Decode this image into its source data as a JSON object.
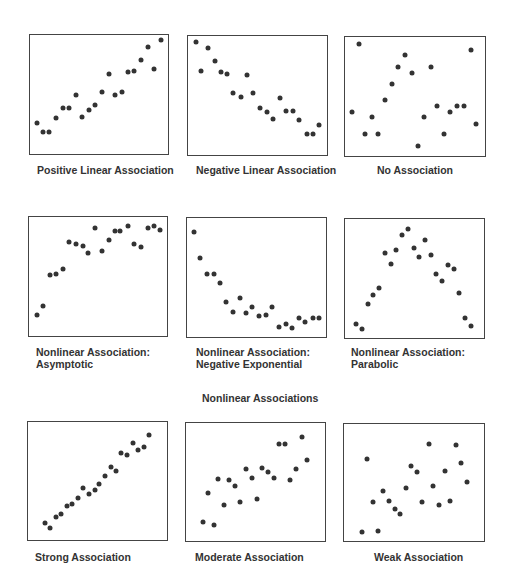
{
  "section_label": "Nonlinear Associations",
  "chart_data": [
    {
      "type": "scatter",
      "title": "Positive Linear Association",
      "points": [
        [
          4.8,
          73.6
        ],
        [
          9.1,
          81.3
        ],
        [
          14.1,
          81.3
        ],
        [
          18.9,
          70.0
        ],
        [
          23.7,
          61.7
        ],
        [
          28.3,
          61.7
        ],
        [
          33.3,
          50.7
        ],
        [
          37.9,
          68.9
        ],
        [
          42.4,
          63.1
        ],
        [
          47.2,
          59.2
        ],
        [
          52.3,
          47.9
        ],
        [
          57.1,
          32.5
        ],
        [
          61.4,
          50.4
        ],
        [
          66.4,
          47.9
        ],
        [
          71.0,
          31.4
        ],
        [
          75.5,
          30.3
        ],
        [
          80.6,
          20.9
        ],
        [
          85.4,
          9.9
        ],
        [
          89.9,
          28.9
        ],
        [
          95.0,
          4.4
        ]
      ]
    },
    {
      "type": "scatter",
      "title": "Negative Linear Association",
      "points": [
        [
          5.4,
          4.7
        ],
        [
          9.7,
          29.4
        ],
        [
          14.7,
          10.0
        ],
        [
          19.6,
          21.1
        ],
        [
          23.9,
          30.6
        ],
        [
          28.1,
          31.7
        ],
        [
          32.6,
          48.3
        ],
        [
          37.8,
          51.1
        ],
        [
          42.1,
          32.8
        ],
        [
          46.8,
          48.3
        ],
        [
          51.5,
          60.6
        ],
        [
          56.5,
          63.9
        ],
        [
          61.0,
          70.0
        ],
        [
          66.2,
          51.7
        ],
        [
          70.7,
          62.8
        ],
        [
          75.2,
          62.8
        ],
        [
          80.1,
          70.8
        ],
        [
          85.4,
          82.5
        ],
        [
          89.6,
          82.5
        ],
        [
          94.1,
          74.7
        ]
      ]
    },
    {
      "type": "scatter",
      "title": "No Association",
      "points": [
        [
          10.3,
          6.1
        ],
        [
          5.2,
          63.2
        ],
        [
          14.5,
          81.7
        ],
        [
          19.2,
          67.6
        ],
        [
          23.9,
          81.7
        ],
        [
          28.3,
          53.2
        ],
        [
          33.5,
          39.1
        ],
        [
          37.9,
          25.0
        ],
        [
          42.6,
          15.2
        ],
        [
          47.5,
          29.9
        ],
        [
          51.8,
          91.7
        ],
        [
          56.7,
          67.6
        ],
        [
          61.4,
          25.0
        ],
        [
          66.0,
          58.4
        ],
        [
          70.7,
          81.7
        ],
        [
          74.9,
          62.9
        ],
        [
          79.9,
          58.4
        ],
        [
          84.8,
          58.4
        ],
        [
          89.7,
          10.8
        ],
        [
          93.7,
          72.9
        ]
      ]
    },
    {
      "type": "scatter",
      "title": "Nonlinear Association:\nAsymptotic",
      "points": [
        [
          5.7,
          82.5
        ],
        [
          9.8,
          74.5
        ],
        [
          15.1,
          49.0
        ],
        [
          19.9,
          47.6
        ],
        [
          24.6,
          43.5
        ],
        [
          29.2,
          20.8
        ],
        [
          34.2,
          23.0
        ],
        [
          38.8,
          24.4
        ],
        [
          43.1,
          30.5
        ],
        [
          48.1,
          9.4
        ],
        [
          52.9,
          28.3
        ],
        [
          57.9,
          19.1
        ],
        [
          62.2,
          11.4
        ],
        [
          66.0,
          11.9
        ],
        [
          71.7,
          7.5
        ],
        [
          76.3,
          22.4
        ],
        [
          81.3,
          24.9
        ],
        [
          86.1,
          9.1
        ],
        [
          90.7,
          7.8
        ],
        [
          95.2,
          10.8
        ]
      ]
    },
    {
      "type": "scatter",
      "title": "Nonlinear Association:\nNegative Exponential",
      "points": [
        [
          5.2,
          11.9
        ],
        [
          9.5,
          33.2
        ],
        [
          14.5,
          46.8
        ],
        [
          19.5,
          46.8
        ],
        [
          23.8,
          54.6
        ],
        [
          28.1,
          70.4
        ],
        [
          32.9,
          79.2
        ],
        [
          37.9,
          67.0
        ],
        [
          42.1,
          80.1
        ],
        [
          46.7,
          75.1
        ],
        [
          51.9,
          82.5
        ],
        [
          56.9,
          81.4
        ],
        [
          61.2,
          75.1
        ],
        [
          66.4,
          91.4
        ],
        [
          70.9,
          89.2
        ],
        [
          75.5,
          92.5
        ],
        [
          80.5,
          83.7
        ],
        [
          85.2,
          87.0
        ],
        [
          90.5,
          83.9
        ],
        [
          95.0,
          83.9
        ]
      ]
    },
    {
      "type": "scatter",
      "title": "Nonlinear Association:\nParabolic",
      "points": [
        [
          7.8,
          87.9
        ],
        [
          12.5,
          92.6
        ],
        [
          16.3,
          71.1
        ],
        [
          20.5,
          63.6
        ],
        [
          24.8,
          57.6
        ],
        [
          28.8,
          28.4
        ],
        [
          33.0,
          38.0
        ],
        [
          36.8,
          25.9
        ],
        [
          41.0,
          13.5
        ],
        [
          45.3,
          8.3
        ],
        [
          49.5,
          24.5
        ],
        [
          53.3,
          32.2
        ],
        [
          57.8,
          17.4
        ],
        [
          61.6,
          30.3
        ],
        [
          65.8,
          46.6
        ],
        [
          70.0,
          51.8
        ],
        [
          73.8,
          38.6
        ],
        [
          78.5,
          41.6
        ],
        [
          82.3,
          62.5
        ],
        [
          86.3,
          83.2
        ],
        [
          90.3,
          89.5
        ]
      ]
    },
    {
      "type": "scatter",
      "title": "Strong Association",
      "points": [
        [
          11.9,
          85.6
        ],
        [
          15.7,
          89.9
        ],
        [
          20.0,
          80.3
        ],
        [
          24.0,
          78.0
        ],
        [
          27.9,
          71.5
        ],
        [
          31.9,
          69.6
        ],
        [
          35.9,
          64.2
        ],
        [
          39.8,
          56.1
        ],
        [
          43.8,
          61.1
        ],
        [
          47.9,
          58.0
        ],
        [
          51.4,
          52.4
        ],
        [
          55.5,
          45.4
        ],
        [
          59.5,
          38.3
        ],
        [
          63.6,
          41.9
        ],
        [
          67.1,
          26.2
        ],
        [
          71.4,
          28.2
        ],
        [
          75.2,
          18.0
        ],
        [
          78.8,
          23.4
        ],
        [
          83.1,
          21.1
        ],
        [
          86.9,
          10.7
        ]
      ]
    },
    {
      "type": "scatter",
      "title": "Moderate Association",
      "points": [
        [
          12.1,
          83.9
        ],
        [
          19.9,
          86.4
        ],
        [
          15.6,
          59.5
        ],
        [
          23.2,
          47.3
        ],
        [
          27.0,
          69.4
        ],
        [
          31.0,
          48.7
        ],
        [
          35.3,
          53.3
        ],
        [
          38.9,
          66.6
        ],
        [
          43.1,
          38.8
        ],
        [
          47.2,
          46.2
        ],
        [
          50.9,
          64.6
        ],
        [
          55.0,
          37.9
        ],
        [
          59.2,
          41.4
        ],
        [
          63.0,
          46.7
        ],
        [
          66.6,
          17.8
        ],
        [
          71.1,
          17.8
        ],
        [
          75.1,
          48.2
        ],
        [
          78.9,
          39.4
        ],
        [
          83.2,
          11.6
        ],
        [
          87.2,
          31.7
        ]
      ]
    },
    {
      "type": "scatter",
      "title": "Weak Association",
      "points": [
        [
          12.5,
          92.7
        ],
        [
          24.5,
          91.3
        ],
        [
          16.2,
          30.1
        ],
        [
          20.5,
          66.8
        ],
        [
          28.2,
          56.9
        ],
        [
          32.2,
          65.6
        ],
        [
          36.2,
          72.7
        ],
        [
          40.2,
          76.9
        ],
        [
          44.5,
          54.4
        ],
        [
          48.2,
          36.3
        ],
        [
          52.2,
          41.4
        ],
        [
          55.8,
          66.5
        ],
        [
          60.5,
          16.9
        ],
        [
          63.8,
          53.2
        ],
        [
          67.8,
          69.6
        ],
        [
          71.8,
          40.3
        ],
        [
          75.5,
          65.6
        ],
        [
          79.8,
          18.3
        ],
        [
          83.5,
          33.2
        ],
        [
          87.5,
          49.3
        ]
      ]
    }
  ]
}
